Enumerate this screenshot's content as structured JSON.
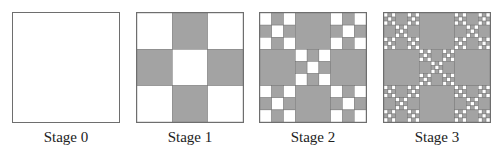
{
  "figure": {
    "colors": {
      "filled": "#a3a3a3",
      "empty": "#ffffff",
      "line": "#6e6e6e"
    },
    "rule": "3x3 grid: edge-middle cells filled; corner and center cells recurse",
    "stages": [
      {
        "label": "Stage 0",
        "depth": 0,
        "left": 12
      },
      {
        "label": "Stage 1",
        "depth": 1,
        "left": 136
      },
      {
        "label": "Stage 2",
        "depth": 2,
        "left": 259
      },
      {
        "label": "Stage 3",
        "depth": 3,
        "left": 383
      }
    ]
  }
}
